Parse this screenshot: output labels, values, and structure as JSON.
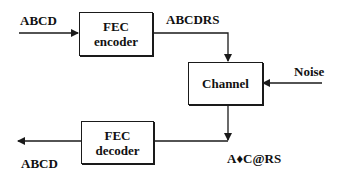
{
  "diagram": {
    "blocks": {
      "encoder": {
        "line1": "FEC",
        "line2": "encoder"
      },
      "channel": {
        "line1": "Channel"
      },
      "decoder": {
        "line1": "FEC",
        "line2": "decoder"
      }
    },
    "labels": {
      "input": "ABCD",
      "encoded": "ABCDRS",
      "noise": "Noise",
      "received": "A♦C@RS",
      "output": "ABCD"
    },
    "edges": [
      {
        "from": "input",
        "to": "encoder"
      },
      {
        "from": "encoder",
        "to": "channel",
        "label": "ABCDRS"
      },
      {
        "from": "noise",
        "to": "channel"
      },
      {
        "from": "channel",
        "to": "decoder",
        "label": "A♦C@RS"
      },
      {
        "from": "decoder",
        "to": "output",
        "label": "ABCD"
      }
    ],
    "colors": {
      "stroke": "#1a1a1a",
      "background": "#ffffff"
    }
  }
}
